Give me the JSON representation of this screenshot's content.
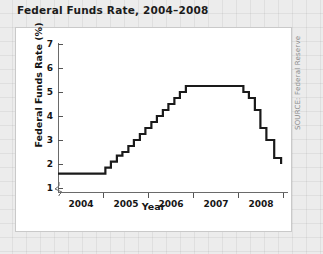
{
  "chart_title": "Federal Funds Rate, 2004–2008",
  "source_note": "SOURCE: Federal Reserve",
  "axes": {
    "ylabel": "Federal Funds Rate (%)",
    "xlabel": "Year",
    "yticks": [
      "1",
      "2",
      "3",
      "4",
      "5",
      "6",
      "7"
    ],
    "xticks": [
      "2004",
      "2005",
      "2006",
      "2007",
      "2008"
    ]
  },
  "chart_data": {
    "type": "line",
    "title": "Federal Funds Rate, 2004–2008",
    "xlabel": "Year",
    "ylabel": "Federal Funds Rate (%)",
    "xlim": [
      2003.6,
      2008.6
    ],
    "ylim": [
      0.75,
      7.4
    ],
    "yticks": [
      1,
      2,
      3,
      4,
      5,
      6,
      7
    ],
    "xticks": [
      2004,
      2005,
      2006,
      2007,
      2008
    ],
    "grid": false,
    "legend": null,
    "axis_break_y": true,
    "step_style": "post",
    "series": [
      {
        "name": "Federal Funds Rate",
        "color": "#1a1a1a",
        "x": [
          2003.6,
          2004.5,
          2004.63,
          2004.75,
          2004.88,
          2005.0,
          2005.13,
          2005.25,
          2005.38,
          2005.5,
          2005.63,
          2005.75,
          2005.88,
          2006.0,
          2006.13,
          2006.25,
          2006.38,
          2006.5,
          2007.63,
          2007.75,
          2007.88,
          2008.0,
          2008.13,
          2008.3,
          2008.45
        ],
        "y": [
          1.6,
          1.6,
          1.85,
          2.1,
          2.35,
          2.5,
          2.75,
          3.0,
          3.25,
          3.5,
          3.75,
          4.0,
          4.25,
          4.5,
          4.75,
          5.0,
          5.25,
          5.25,
          5.0,
          4.75,
          4.25,
          3.5,
          3.0,
          2.25,
          2.0
        ]
      }
    ]
  }
}
